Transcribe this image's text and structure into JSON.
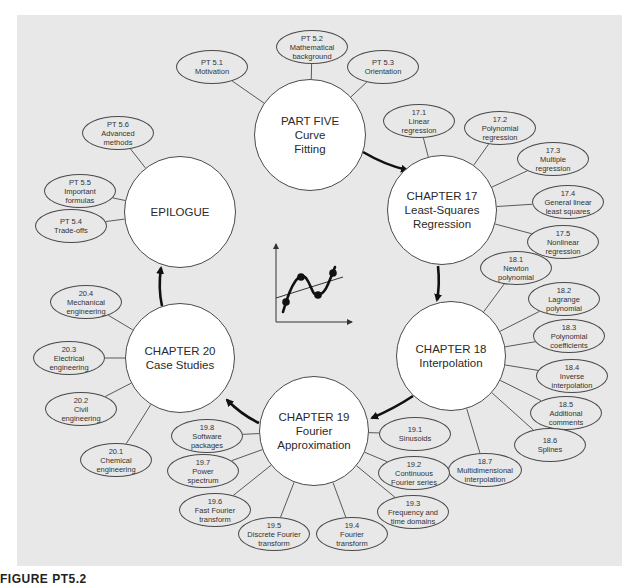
{
  "figure": {
    "caption": "FIGURE PT5.2",
    "background_color": "#e8e8e8",
    "line_color": "#4a4a4a",
    "arrow_color": "#111111"
  },
  "hubs": [
    {
      "id": "part5",
      "lines": [
        "PART FIVE",
        "Curve",
        "Fitting"
      ],
      "cx": 310,
      "cy": 135,
      "r": 56
    },
    {
      "id": "ch17",
      "lines": [
        "CHAPTER 17",
        "Least-Squares",
        "Regression"
      ],
      "cx": 442,
      "cy": 210,
      "r": 55
    },
    {
      "id": "ch18",
      "lines": [
        "CHAPTER 18",
        "Interpolation"
      ],
      "cx": 451,
      "cy": 356,
      "r": 55
    },
    {
      "id": "ch19",
      "lines": [
        "CHAPTER 19",
        "Fourier",
        "Approximation"
      ],
      "cx": 314,
      "cy": 431,
      "r": 55
    },
    {
      "id": "ch20",
      "lines": [
        "CHAPTER 20",
        "Case Studies"
      ],
      "cx": 180,
      "cy": 358,
      "r": 55
    },
    {
      "id": "epilogue",
      "lines": [
        "EPILOGUE"
      ],
      "cx": 180,
      "cy": 212,
      "r": 56
    }
  ],
  "leaves": [
    {
      "hub": "part5",
      "lines": [
        "PT 5.1",
        "Motivation"
      ],
      "cx": 212,
      "cy": 67,
      "w": 72,
      "h": 34
    },
    {
      "hub": "part5",
      "lines": [
        "PT 5.2",
        "Mathematical",
        "background"
      ],
      "cx": 312,
      "cy": 47,
      "w": 72,
      "h": 34
    },
    {
      "hub": "part5",
      "lines": [
        "PT 5.3",
        "Orientation"
      ],
      "cx": 383,
      "cy": 67,
      "w": 72,
      "h": 34
    },
    {
      "hub": "ch17",
      "lines": [
        "17.1",
        "Linear",
        "regression"
      ],
      "cx": 419,
      "cy": 121,
      "w": 72,
      "h": 34
    },
    {
      "hub": "ch17",
      "lines": [
        "17.2",
        "Polynomial",
        "regression"
      ],
      "cx": 500,
      "cy": 128,
      "w": 72,
      "h": 34
    },
    {
      "hub": "ch17",
      "lines": [
        "17.3",
        "Multiple",
        "regression"
      ],
      "cx": 553,
      "cy": 159,
      "w": 72,
      "h": 34
    },
    {
      "hub": "ch17",
      "lines": [
        "17.4",
        "General linear",
        "least squares"
      ],
      "cx": 568,
      "cy": 202,
      "w": 72,
      "h": 34
    },
    {
      "hub": "ch17",
      "lines": [
        "17.5",
        "Nonlinear",
        "regression"
      ],
      "cx": 563,
      "cy": 242,
      "w": 72,
      "h": 34
    },
    {
      "hub": "ch18",
      "lines": [
        "18.1",
        "Newton",
        "polynomial"
      ],
      "cx": 516,
      "cy": 268,
      "w": 72,
      "h": 34
    },
    {
      "hub": "ch18",
      "lines": [
        "18.2",
        "Lagrange",
        "polynomial"
      ],
      "cx": 564,
      "cy": 299,
      "w": 72,
      "h": 34
    },
    {
      "hub": "ch18",
      "lines": [
        "18.3",
        "Polynomial",
        "coefficients"
      ],
      "cx": 569,
      "cy": 336,
      "w": 72,
      "h": 34
    },
    {
      "hub": "ch18",
      "lines": [
        "18.4",
        "Inverse",
        "interpolation"
      ],
      "cx": 572,
      "cy": 376,
      "w": 72,
      "h": 34
    },
    {
      "hub": "ch18",
      "lines": [
        "18.5",
        "Additional",
        "comments"
      ],
      "cx": 566,
      "cy": 413,
      "w": 72,
      "h": 34
    },
    {
      "hub": "ch18",
      "lines": [
        "18.6",
        "Splines"
      ],
      "cx": 550,
      "cy": 445,
      "w": 72,
      "h": 34
    },
    {
      "hub": "ch18",
      "lines": [
        "18.7",
        "Multidimensional",
        "interpolation"
      ],
      "cx": 485,
      "cy": 470,
      "w": 74,
      "h": 34
    },
    {
      "hub": "ch19",
      "lines": [
        "19.1",
        "Sinusoids"
      ],
      "cx": 415,
      "cy": 434,
      "w": 72,
      "h": 34
    },
    {
      "hub": "ch19",
      "lines": [
        "19.2",
        "Continuous",
        "Fourier series"
      ],
      "cx": 414,
      "cy": 473,
      "w": 72,
      "h": 34
    },
    {
      "hub": "ch19",
      "lines": [
        "19.3",
        "Frequency and",
        "time domains"
      ],
      "cx": 413,
      "cy": 512,
      "w": 72,
      "h": 34
    },
    {
      "hub": "ch19",
      "lines": [
        "19.4",
        "Fourier",
        "transform"
      ],
      "cx": 352,
      "cy": 534,
      "w": 72,
      "h": 34
    },
    {
      "hub": "ch19",
      "lines": [
        "19.5",
        "Discrete Fourier",
        "transform"
      ],
      "cx": 274,
      "cy": 534,
      "w": 72,
      "h": 34
    },
    {
      "hub": "ch19",
      "lines": [
        "19.6",
        "Fast Fourier",
        "transform"
      ],
      "cx": 215,
      "cy": 510,
      "w": 72,
      "h": 34
    },
    {
      "hub": "ch19",
      "lines": [
        "19.7",
        "Power",
        "spectrum"
      ],
      "cx": 203,
      "cy": 471,
      "w": 72,
      "h": 34
    },
    {
      "hub": "ch19",
      "lines": [
        "19.8",
        "Software",
        "packages"
      ],
      "cx": 207,
      "cy": 436,
      "w": 72,
      "h": 34
    },
    {
      "hub": "ch20",
      "lines": [
        "20.1",
        "Chemical",
        "engineering"
      ],
      "cx": 116,
      "cy": 460,
      "w": 72,
      "h": 34
    },
    {
      "hub": "ch20",
      "lines": [
        "20.2",
        "Civil",
        "engineering"
      ],
      "cx": 81,
      "cy": 409,
      "w": 72,
      "h": 34
    },
    {
      "hub": "ch20",
      "lines": [
        "20.3",
        "Electrical",
        "engineering"
      ],
      "cx": 69,
      "cy": 358,
      "w": 72,
      "h": 34
    },
    {
      "hub": "ch20",
      "lines": [
        "20.4",
        "Mechanical",
        "engineering"
      ],
      "cx": 86,
      "cy": 302,
      "w": 72,
      "h": 34
    },
    {
      "hub": "epilogue",
      "lines": [
        "PT 5.6",
        "Advanced",
        "methods"
      ],
      "cx": 118,
      "cy": 133,
      "w": 72,
      "h": 34
    },
    {
      "hub": "epilogue",
      "lines": [
        "PT 5.5",
        "Important",
        "formulas"
      ],
      "cx": 80,
      "cy": 191,
      "w": 72,
      "h": 34
    },
    {
      "hub": "epilogue",
      "lines": [
        "PT 5.4",
        "Trade-offs"
      ],
      "cx": 71,
      "cy": 226,
      "w": 72,
      "h": 34
    }
  ],
  "flow": [
    {
      "from": "part5",
      "to": "ch17",
      "path": "M 363 152 Q 385 165 407 170"
    },
    {
      "from": "ch17",
      "to": "ch18",
      "path": "M 438 266 Q 440 285 437 300"
    },
    {
      "from": "ch18",
      "to": "ch19",
      "path": "M 413 396 Q 395 408 372 418"
    },
    {
      "from": "ch19",
      "to": "ch20",
      "path": "M 259 423 Q 242 415 227 400"
    },
    {
      "from": "ch20",
      "to": "epilogue",
      "path": "M 162 306 Q 158 288 161 268"
    }
  ],
  "center_icon": {
    "name": "curve-fitting-plot-icon",
    "points": [
      [
        287,
        302
      ],
      [
        302,
        278
      ],
      [
        318,
        295
      ],
      [
        333,
        273
      ]
    ]
  }
}
